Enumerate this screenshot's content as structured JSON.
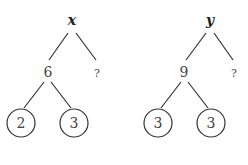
{
  "trees": [
    {
      "root": "x",
      "middle": "6",
      "unknown": "?",
      "leaves": [
        "2",
        "3"
      ]
    },
    {
      "root": "y",
      "middle": "9",
      "unknown": "?",
      "leaves": [
        "3",
        "3"
      ]
    }
  ],
  "colors": {
    "line": "#333333",
    "text": "#444444"
  }
}
